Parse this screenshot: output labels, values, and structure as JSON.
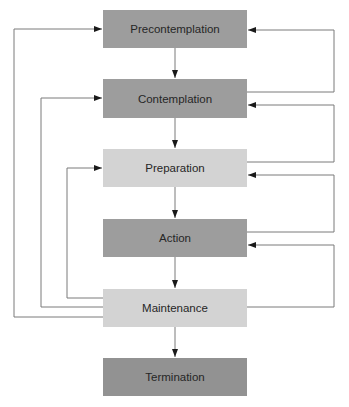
{
  "diagram": {
    "type": "flowchart",
    "title": "",
    "stages": [
      {
        "id": "precontemplation",
        "label": "Precontemplation",
        "shade": "dark"
      },
      {
        "id": "contemplation",
        "label": "Contemplation",
        "shade": "dark"
      },
      {
        "id": "preparation",
        "label": "Preparation",
        "shade": "light"
      },
      {
        "id": "action",
        "label": "Action",
        "shade": "dark"
      },
      {
        "id": "maintenance",
        "label": "Maintenance",
        "shade": "light"
      },
      {
        "id": "termination",
        "label": "Termination",
        "shade": "darker"
      }
    ],
    "forward_edges": [
      {
        "from": "precontemplation",
        "to": "contemplation"
      },
      {
        "from": "contemplation",
        "to": "preparation"
      },
      {
        "from": "preparation",
        "to": "action"
      },
      {
        "from": "action",
        "to": "maintenance"
      },
      {
        "from": "maintenance",
        "to": "termination"
      }
    ],
    "relapse_edges_right": [
      {
        "from": "contemplation",
        "to": "precontemplation"
      },
      {
        "from": "preparation",
        "to": "contemplation"
      },
      {
        "from": "action",
        "to": "preparation"
      },
      {
        "from": "maintenance",
        "to": "action"
      }
    ],
    "relapse_edges_left": [
      {
        "from": "maintenance",
        "to": "precontemplation"
      },
      {
        "from": "maintenance",
        "to": "contemplation"
      },
      {
        "from": "maintenance",
        "to": "preparation"
      }
    ],
    "colors": {
      "dark": "#9d9d9d",
      "light": "#d3d3d3",
      "darker": "#929292",
      "line": "#7a7a7a",
      "arrow": "#1a1a1a",
      "text": "#262626"
    }
  }
}
